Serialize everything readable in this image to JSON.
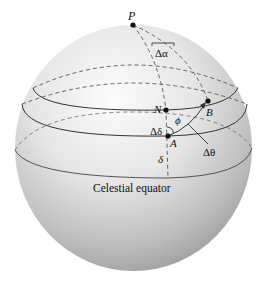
{
  "diagram": {
    "labels": {
      "pole": "P",
      "delta_alpha": "Δα",
      "point_n": "N",
      "point_b": "B",
      "phi": "ϕ",
      "delta_delta": "Δδ",
      "point_a": "A",
      "delta_theta": "Δθ",
      "delta": "δ",
      "equator": "Celestial equator"
    },
    "colors": {
      "sphere_light": "#fafafa",
      "sphere_dark": "#9a9a9a",
      "line": "#333333",
      "dashed": "#555555"
    }
  }
}
